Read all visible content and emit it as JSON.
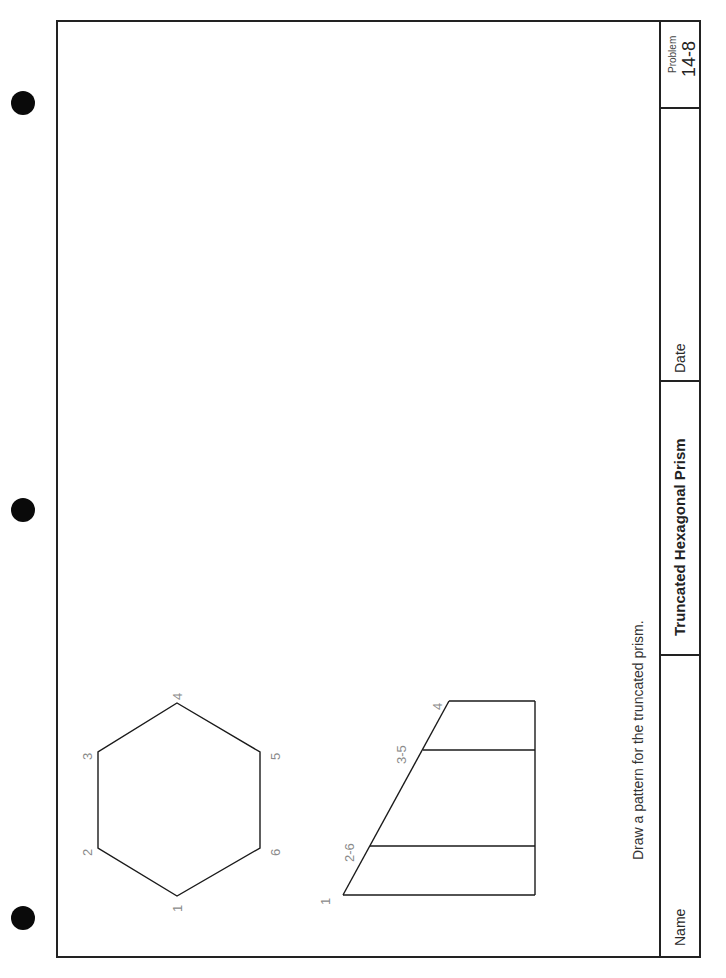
{
  "worksheet": {
    "instruction": "Draw a pattern for the truncated prism.",
    "title_block": {
      "name_label": "Name",
      "title": "Truncated Hexagonal Prism",
      "date_label": "Date",
      "problem_label": "Problem",
      "problem_number": "14-8"
    },
    "top_view": {
      "shape": "hexagon",
      "vertex_labels": [
        "1",
        "2",
        "3",
        "4",
        "5",
        "6"
      ]
    },
    "front_view": {
      "shape": "truncated prism elevation",
      "edge_labels": [
        "1",
        "2-6",
        "3-5",
        "4"
      ]
    },
    "colors": {
      "line": "#1a1a1a",
      "label_gray": "#8a8a8a",
      "punch_hole": "#0a0a0a"
    }
  }
}
